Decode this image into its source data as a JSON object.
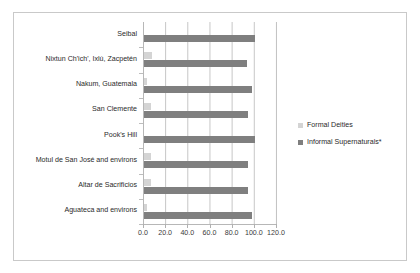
{
  "chart_data": {
    "type": "bar",
    "orientation": "horizontal",
    "title": "",
    "xlabel": "",
    "ylabel": "",
    "xlim": [
      0.0,
      120.0
    ],
    "xticks": [
      "0.0",
      "20.0",
      "40.0",
      "60.0",
      "80.0",
      "100.0",
      "120.0"
    ],
    "xtick_values": [
      0,
      20,
      40,
      60,
      80,
      100,
      120
    ],
    "grid": true,
    "legend_position": "right",
    "categories": [
      "Seibal",
      "Nixtun Ch'ich', Ixlú, Zacpetén",
      "Nakum, Guatemala",
      "San Clemente",
      "Pook's Hill",
      "Motul de San José and environs",
      "Altar de Sacrificios",
      "Aguateca and environs"
    ],
    "series": [
      {
        "name": "Formal Deities",
        "color": "#d4d4d4",
        "values": [
          0,
          7,
          3,
          6,
          0,
          6,
          6,
          3
        ]
      },
      {
        "name": "Informal Supernaturals*",
        "color": "#7f7f7f",
        "values": [
          100,
          93,
          97,
          94,
          100,
          94,
          94,
          97
        ]
      }
    ]
  },
  "legend": {
    "items": [
      {
        "label": "Formal Deities",
        "color": "#d4d4d4"
      },
      {
        "label": "Informal Supernaturals*",
        "color": "#7f7f7f"
      }
    ]
  }
}
